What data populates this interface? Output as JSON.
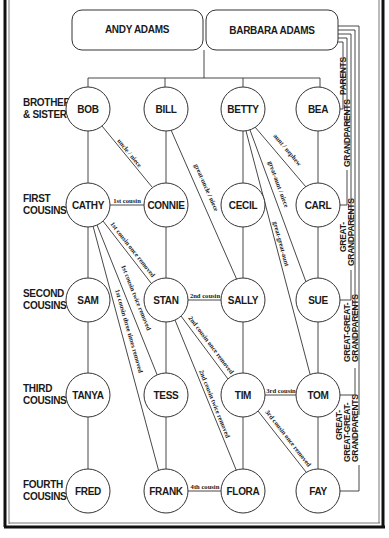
{
  "parents": {
    "father": "ANDY ADAMS",
    "mother": "BARBARA ADAMS"
  },
  "row_labels": [
    {
      "line1": "BROTHERS",
      "line2": "& SISTERS"
    },
    {
      "line1": "FIRST",
      "line2": "COUSINS"
    },
    {
      "line1": "SECOND",
      "line2": "COUSINS"
    },
    {
      "line1": "THIRD",
      "line2": "COUSINS"
    },
    {
      "line1": "FOURTH",
      "line2": "COUSINS"
    }
  ],
  "nodes": {
    "row1": [
      "BOB",
      "BILL",
      "BETTY",
      "BEA"
    ],
    "row2": [
      "CATHY",
      "CONNIE",
      "CECIL",
      "CARL"
    ],
    "row3": [
      "SAM",
      "STAN",
      "SALLY",
      "SUE"
    ],
    "row4": [
      "TANYA",
      "TESS",
      "TIM",
      "TOM"
    ],
    "row5": [
      "FRED",
      "FRANK",
      "FLORA",
      "FAY"
    ]
  },
  "relationships": {
    "bob_connie": "uncle / niece",
    "bill_sally": "great-uncle / niece",
    "betty_carl": "aunt / nephew",
    "betty_sue": "great-aunt / niece",
    "betty_tom": "great-great-aunt",
    "cathy_connie": "1st cousin",
    "cathy_stan": "1st cousin once removed",
    "cathy_tess": "1st cousin twice removed",
    "cathy_frank": "1st cousin three times removed",
    "stan_sally": "2nd cousin",
    "stan_tim": "2nd cousin once removed",
    "stan_flora": "2nd cousin twice removed",
    "tim_tom": "3rd cousin",
    "tim_fay": "3rd cousin once removed",
    "frank_flora": "4th cousin"
  },
  "brackets": [
    {
      "lines": [
        "PARENTS"
      ]
    },
    {
      "lines": [
        "GRANDPARENTS"
      ]
    },
    {
      "lines": [
        "GREAT-",
        "GRANDPARENTS"
      ]
    },
    {
      "lines": [
        "GREAT-GREAT-",
        "GRANDPARENTS"
      ]
    },
    {
      "lines": [
        "GREAT-",
        "GREAT-GREAT-",
        "GRANDPARENTS"
      ]
    }
  ],
  "colors": {
    "line": "#333333",
    "text": "#1a1a1a",
    "background": "#ffffff",
    "frame": "#111111"
  }
}
